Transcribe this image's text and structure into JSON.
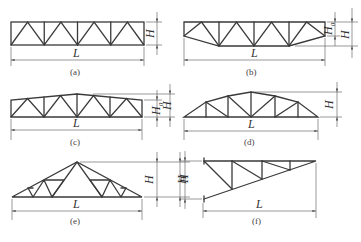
{
  "figure": {
    "panels": [
      {
        "id": "a",
        "caption": "(a)",
        "length_label": "L",
        "height_labels": [
          "H"
        ],
        "shape": "parallel-chord truss"
      },
      {
        "id": "b",
        "caption": "(b)",
        "length_label": "L",
        "height_labels": [
          "H",
          "H0"
        ],
        "shape": "parallel chord truss with dropped end bottom chord"
      },
      {
        "id": "c",
        "caption": "(c)",
        "length_label": "L",
        "height_labels": [
          "H",
          "H0"
        ],
        "shape": "trapezoidal truss with low pitch top chord"
      },
      {
        "id": "d",
        "caption": "(d)",
        "length_label": "L",
        "height_labels": [
          "H"
        ],
        "shape": "polygonal (arched) truss"
      },
      {
        "id": "e",
        "caption": "(e)",
        "length_label": "L",
        "height_labels": [
          "H",
          "H"
        ],
        "shape": "triangular truss"
      },
      {
        "id": "f",
        "caption": "(f)",
        "length_label": "L",
        "height_labels": [
          "H"
        ],
        "shape": "cantilever triangular truss"
      }
    ]
  },
  "labels": {
    "L": "L",
    "H": "H",
    "H0_main": "H",
    "H0_sub": "0",
    "cap_a": "(a)",
    "cap_b": "(b)",
    "cap_c": "(c)",
    "cap_d": "(d)",
    "cap_e": "(e)",
    "cap_f": "(f)"
  },
  "colors": {
    "line": "#3a3a3a",
    "background": "#ffffff"
  }
}
